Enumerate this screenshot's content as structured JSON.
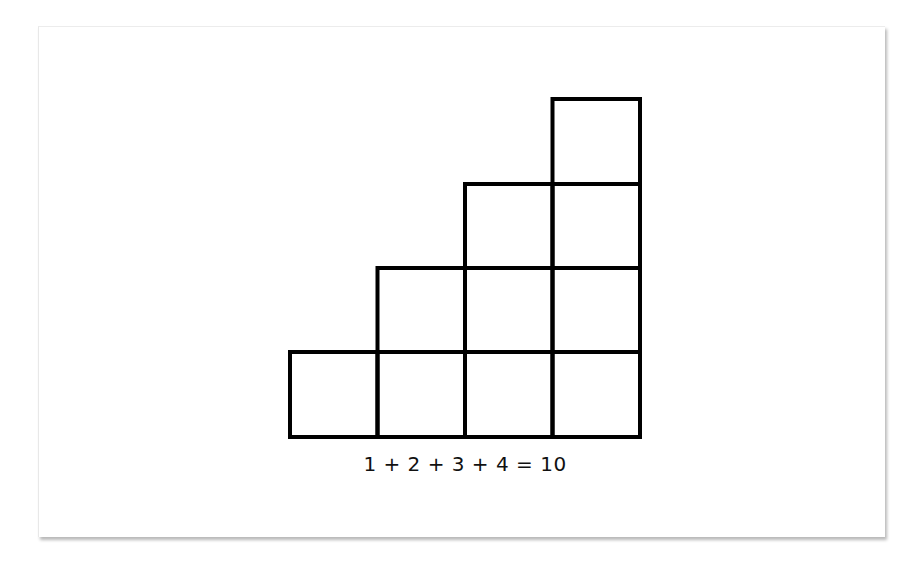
{
  "diagram": {
    "stroke_color": "#000000",
    "fill_color": "#ffffff",
    "columns": [
      {
        "index": 1,
        "squares": 1
      },
      {
        "index": 2,
        "squares": 2
      },
      {
        "index": 3,
        "squares": 3
      },
      {
        "index": 4,
        "squares": 4
      }
    ],
    "caption": "1 + 2 + 3 + 4 = 10"
  }
}
